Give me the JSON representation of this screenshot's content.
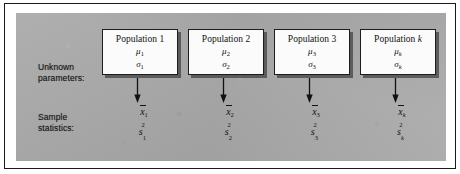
{
  "figure": {
    "background_color": "#a9a9a9",
    "box_fill_color": "#fbfbfb",
    "ink_color": "#111111",
    "row_labels": {
      "unknown_parameters_line1": "Unknown",
      "unknown_parameters_line2": "parameters:",
      "sample_statistics_line1": "Sample",
      "sample_statistics_line2": "statistics:"
    },
    "columns": [
      {
        "title_prefix": "Population",
        "title_index": "1",
        "index_is_variable": false,
        "mean_symbol": "μ",
        "mean_subscript": "1",
        "sd_symbol": "σ",
        "sd_subscript": "1",
        "sample_mean_symbol": "x",
        "sample_mean_subscript": "1",
        "sample_var_symbol": "s",
        "sample_var_subscript": "1",
        "sample_var_superscript": "2"
      },
      {
        "title_prefix": "Population",
        "title_index": "2",
        "index_is_variable": false,
        "mean_symbol": "μ",
        "mean_subscript": "2",
        "sd_symbol": "σ",
        "sd_subscript": "2",
        "sample_mean_symbol": "x",
        "sample_mean_subscript": "2",
        "sample_var_symbol": "s",
        "sample_var_subscript": "2",
        "sample_var_superscript": "2"
      },
      {
        "title_prefix": "Population",
        "title_index": "3",
        "index_is_variable": false,
        "mean_symbol": "μ",
        "mean_subscript": "3",
        "sd_symbol": "σ",
        "sd_subscript": "3",
        "sample_mean_symbol": "x",
        "sample_mean_subscript": "3",
        "sample_var_symbol": "s",
        "sample_var_subscript": "3",
        "sample_var_superscript": "2"
      },
      {
        "title_prefix": "Population",
        "title_index": "k",
        "index_is_variable": true,
        "mean_symbol": "μ",
        "mean_subscript": "k",
        "sd_symbol": "σ",
        "sd_subscript": "k",
        "sample_mean_symbol": "x",
        "sample_mean_subscript": "k",
        "sample_var_symbol": "s",
        "sample_var_subscript": "k",
        "sample_var_superscript": "2"
      }
    ]
  }
}
